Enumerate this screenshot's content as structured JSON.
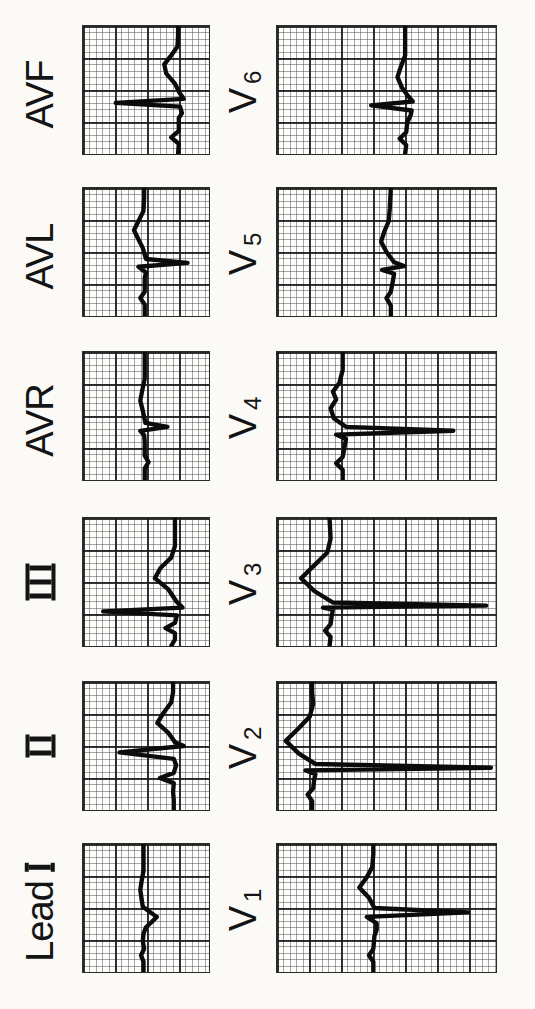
{
  "figure": {
    "kind": "scanned 12-lead electrocardiogram figure, rotated 90° counter-clockwise (labels read bottom-to-top)",
    "rows_portrait_top_to_bottom": [
      [
        "AVF",
        "V6"
      ],
      [
        "AVL",
        "V5"
      ],
      [
        "AVR",
        "V4"
      ],
      [
        "III",
        "V3"
      ],
      [
        "II",
        "V2"
      ],
      [
        "Lead I",
        "V1"
      ]
    ]
  },
  "colors": {
    "ink": "#0b0b0b",
    "paper": "#fefdfb",
    "page_background": "#fbfaf7",
    "grid_major": "#191919",
    "grid_minor": "#464646"
  },
  "chart_data": {
    "type": "line",
    "title": "",
    "points_format": "[time 0-1 from start to end of strip, level 0-1 from top of un-rotated strip]; renderer rotates 90° CCW",
    "grid": {
      "minor_px": 6.4,
      "major_px": 32
    },
    "leads": [
      {
        "id": "lead-i",
        "label_text": "Lead",
        "label_roman": "I",
        "label_sub": "",
        "morphology": "low voltage, small mostly negative QRS, flat T",
        "points": [
          [
            0,
            0.48
          ],
          [
            0.08,
            0.48
          ],
          [
            0.13,
            0.46
          ],
          [
            0.18,
            0.485
          ],
          [
            0.24,
            0.475
          ],
          [
            0.3,
            0.48
          ],
          [
            0.35,
            0.5
          ],
          [
            0.39,
            0.545
          ],
          [
            0.43,
            0.585
          ],
          [
            0.47,
            0.53
          ],
          [
            0.51,
            0.475
          ],
          [
            0.57,
            0.465
          ],
          [
            0.64,
            0.455
          ],
          [
            0.71,
            0.465
          ],
          [
            0.79,
            0.48
          ],
          [
            0.9,
            0.48
          ],
          [
            1,
            0.48
          ]
        ]
      },
      {
        "id": "lead-ii",
        "label_text": "",
        "label_roman": "II",
        "label_sub": "",
        "morphology": "upright P, tall R, small S, upright T",
        "points": [
          [
            0,
            0.72
          ],
          [
            0.08,
            0.72
          ],
          [
            0.14,
            0.715
          ],
          [
            0.21,
            0.72
          ],
          [
            0.25,
            0.61
          ],
          [
            0.29,
            0.72
          ],
          [
            0.35,
            0.74
          ],
          [
            0.4,
            0.72
          ],
          [
            0.45,
            0.29
          ],
          [
            0.5,
            0.8
          ],
          [
            0.53,
            0.73
          ],
          [
            0.6,
            0.68
          ],
          [
            0.68,
            0.59
          ],
          [
            0.76,
            0.64
          ],
          [
            0.84,
            0.7
          ],
          [
            0.92,
            0.715
          ],
          [
            1,
            0.715
          ]
        ]
      },
      {
        "id": "lead-iii",
        "label_text": "",
        "label_roman": "III",
        "label_sub": "",
        "morphology": "upright P, very tall narrow R, small S, upright T",
        "points": [
          [
            0,
            0.7
          ],
          [
            0.05,
            0.73
          ],
          [
            0.1,
            0.73
          ],
          [
            0.14,
            0.655
          ],
          [
            0.18,
            0.73
          ],
          [
            0.24,
            0.745
          ],
          [
            0.27,
            0.16
          ],
          [
            0.3,
            0.79
          ],
          [
            0.35,
            0.74
          ],
          [
            0.44,
            0.68
          ],
          [
            0.53,
            0.57
          ],
          [
            0.61,
            0.615
          ],
          [
            0.69,
            0.7
          ],
          [
            0.78,
            0.73
          ],
          [
            0.9,
            0.73
          ],
          [
            1,
            0.73
          ]
        ]
      },
      {
        "id": "avr",
        "label_text": "AVR",
        "label_roman": "",
        "label_sub": "",
        "morphology": "small inverted P, sharp negative QS spike, shallow negative-then-flat T",
        "points": [
          [
            0,
            0.49
          ],
          [
            0.09,
            0.49
          ],
          [
            0.14,
            0.52
          ],
          [
            0.19,
            0.49
          ],
          [
            0.3,
            0.49
          ],
          [
            0.35,
            0.485
          ],
          [
            0.385,
            0.455
          ],
          [
            0.415,
            0.67
          ],
          [
            0.445,
            0.495
          ],
          [
            0.54,
            0.475
          ],
          [
            0.62,
            0.455
          ],
          [
            0.7,
            0.47
          ],
          [
            0.79,
            0.49
          ],
          [
            0.9,
            0.49
          ],
          [
            1,
            0.49
          ]
        ]
      },
      {
        "id": "avl",
        "label_text": "AVL",
        "label_roman": "",
        "label_sub": "",
        "morphology": "small P, rS with deep narrow S spike, upright T",
        "points": [
          [
            0,
            0.49
          ],
          [
            0.09,
            0.49
          ],
          [
            0.14,
            0.455
          ],
          [
            0.19,
            0.49
          ],
          [
            0.3,
            0.49
          ],
          [
            0.34,
            0.5
          ],
          [
            0.385,
            0.44
          ],
          [
            0.415,
            0.83
          ],
          [
            0.445,
            0.5
          ],
          [
            0.53,
            0.475
          ],
          [
            0.6,
            0.44
          ],
          [
            0.67,
            0.405
          ],
          [
            0.74,
            0.44
          ],
          [
            0.82,
            0.48
          ],
          [
            0.92,
            0.485
          ],
          [
            1,
            0.485
          ]
        ]
      },
      {
        "id": "avf",
        "label_text": "AVF",
        "label_roman": "",
        "label_sub": "",
        "morphology": "upright P, tall narrow R, small S, broad upright T",
        "points": [
          [
            0,
            0.755
          ],
          [
            0.08,
            0.76
          ],
          [
            0.13,
            0.7
          ],
          [
            0.18,
            0.76
          ],
          [
            0.28,
            0.76
          ],
          [
            0.32,
            0.785
          ],
          [
            0.37,
            0.77
          ],
          [
            0.4,
            0.26
          ],
          [
            0.43,
            0.8
          ],
          [
            0.48,
            0.765
          ],
          [
            0.55,
            0.73
          ],
          [
            0.63,
            0.66
          ],
          [
            0.7,
            0.645
          ],
          [
            0.77,
            0.7
          ],
          [
            0.84,
            0.75
          ],
          [
            0.93,
            0.755
          ],
          [
            1,
            0.755
          ]
        ]
      },
      {
        "id": "v1",
        "label_text": "V",
        "label_roman": "",
        "label_sub": "1",
        "morphology": "small r, deep narrow S, upright T",
        "points": [
          [
            0,
            0.44
          ],
          [
            0.08,
            0.44
          ],
          [
            0.13,
            0.42
          ],
          [
            0.18,
            0.44
          ],
          [
            0.28,
            0.445
          ],
          [
            0.33,
            0.455
          ],
          [
            0.38,
            0.455
          ],
          [
            0.43,
            0.41
          ],
          [
            0.465,
            0.873
          ],
          [
            0.5,
            0.445
          ],
          [
            0.58,
            0.42
          ],
          [
            0.66,
            0.376
          ],
          [
            0.74,
            0.41
          ],
          [
            0.82,
            0.435
          ],
          [
            0.92,
            0.44
          ],
          [
            1,
            0.44
          ]
        ]
      },
      {
        "id": "v2",
        "label_text": "V",
        "label_roman": "",
        "label_sub": "2",
        "morphology": "rS with very deep needle-like S reaching strip edge, large upright T",
        "points": [
          [
            0,
            0.16
          ],
          [
            0.07,
            0.16
          ],
          [
            0.12,
            0.14
          ],
          [
            0.17,
            0.165
          ],
          [
            0.24,
            0.17
          ],
          [
            0.28,
            0.175
          ],
          [
            0.31,
            0.13
          ],
          [
            0.33,
            0.977
          ],
          [
            0.36,
            0.175
          ],
          [
            0.44,
            0.1
          ],
          [
            0.54,
            0.04
          ],
          [
            0.64,
            0.1
          ],
          [
            0.73,
            0.15
          ],
          [
            0.83,
            0.165
          ],
          [
            0.92,
            0.16
          ],
          [
            1,
            0.16
          ]
        ]
      },
      {
        "id": "v3",
        "label_text": "V",
        "label_roman": "",
        "label_sub": "3",
        "morphology": "rS with very deep needle-like S, large upright T",
        "points": [
          [
            0,
            0.24
          ],
          [
            0.07,
            0.245
          ],
          [
            0.12,
            0.22
          ],
          [
            0.17,
            0.245
          ],
          [
            0.24,
            0.25
          ],
          [
            0.285,
            0.255
          ],
          [
            0.3,
            0.21
          ],
          [
            0.315,
            0.955
          ],
          [
            0.34,
            0.255
          ],
          [
            0.43,
            0.17
          ],
          [
            0.53,
            0.11
          ],
          [
            0.63,
            0.17
          ],
          [
            0.73,
            0.23
          ],
          [
            0.84,
            0.245
          ],
          [
            1,
            0.24
          ]
        ]
      },
      {
        "id": "v4",
        "label_text": "V",
        "label_roman": "",
        "label_sub": "4",
        "morphology": "small r, deep narrow S, upright slightly notched T",
        "points": [
          [
            0,
            0.3
          ],
          [
            0.08,
            0.3
          ],
          [
            0.13,
            0.27
          ],
          [
            0.18,
            0.3
          ],
          [
            0.27,
            0.31
          ],
          [
            0.32,
            0.315
          ],
          [
            0.355,
            0.27
          ],
          [
            0.385,
            0.805
          ],
          [
            0.415,
            0.315
          ],
          [
            0.48,
            0.26
          ],
          [
            0.56,
            0.245
          ],
          [
            0.63,
            0.27
          ],
          [
            0.69,
            0.255
          ],
          [
            0.76,
            0.285
          ],
          [
            0.86,
            0.3
          ],
          [
            1,
            0.3
          ]
        ]
      },
      {
        "id": "v5",
        "label_text": "V",
        "label_roman": "",
        "label_sub": "5",
        "morphology": "low-voltage rS, small upright T",
        "points": [
          [
            0,
            0.52
          ],
          [
            0.08,
            0.52
          ],
          [
            0.14,
            0.5
          ],
          [
            0.19,
            0.52
          ],
          [
            0.28,
            0.53
          ],
          [
            0.33,
            0.535
          ],
          [
            0.36,
            0.48
          ],
          [
            0.39,
            0.58
          ],
          [
            0.42,
            0.535
          ],
          [
            0.5,
            0.5
          ],
          [
            0.58,
            0.475
          ],
          [
            0.66,
            0.49
          ],
          [
            0.74,
            0.51
          ],
          [
            0.84,
            0.515
          ],
          [
            1,
            0.52
          ]
        ]
      },
      {
        "id": "v6",
        "label_text": "V",
        "label_roman": "",
        "label_sub": "6",
        "morphology": "small P, moderate R spike, small S, gentle upright T",
        "points": [
          [
            0,
            0.585
          ],
          [
            0.07,
            0.59
          ],
          [
            0.12,
            0.56
          ],
          [
            0.17,
            0.59
          ],
          [
            0.25,
            0.595
          ],
          [
            0.3,
            0.61
          ],
          [
            0.34,
            0.615
          ],
          [
            0.38,
            0.43
          ],
          [
            0.41,
            0.62
          ],
          [
            0.45,
            0.6
          ],
          [
            0.52,
            0.57
          ],
          [
            0.6,
            0.55
          ],
          [
            0.68,
            0.565
          ],
          [
            0.77,
            0.585
          ],
          [
            0.9,
            0.585
          ],
          [
            1,
            0.585
          ]
        ]
      }
    ]
  }
}
